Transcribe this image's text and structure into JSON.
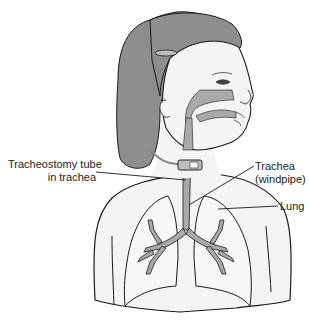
{
  "diagram": {
    "colors": {
      "hair": "#8e8e8e",
      "airway": "#a9a9a9",
      "skin": "#f4f4f4",
      "outline": "#1a1a1a",
      "label_text": "#222222"
    },
    "labels": [
      {
        "id": "tube",
        "line1": "Tracheostomy tube",
        "line2": "in trachea"
      },
      {
        "id": "trachea",
        "line1": "Trachea",
        "line2": "(windpipe)"
      },
      {
        "id": "lung",
        "line1": "Lung"
      }
    ]
  }
}
